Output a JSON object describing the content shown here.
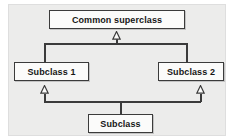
{
  "diagram": {
    "type": "uml-class-diagram",
    "panel_color": "#ececeb",
    "node_fill": "#fbfbfa",
    "line_color": "#3b3b3b",
    "nodes": [
      {
        "id": "superclass",
        "label": "Common superclass"
      },
      {
        "id": "subclass1",
        "label": "Subclass 1"
      },
      {
        "id": "subclass2",
        "label": "Subclass 2"
      },
      {
        "id": "subclass",
        "label": "Subclass"
      }
    ],
    "relations": [
      {
        "from": "Subclass 1",
        "to": "Common superclass",
        "kind": "generalization"
      },
      {
        "from": "Subclass 2",
        "to": "Common superclass",
        "kind": "generalization"
      },
      {
        "from": "Subclass",
        "to": "Subclass 1",
        "kind": "generalization"
      },
      {
        "from": "Subclass",
        "to": "Subclass 2",
        "kind": "generalization"
      }
    ],
    "arrowheads": {
      "style": "hollow-triangle",
      "count": 3
    }
  }
}
